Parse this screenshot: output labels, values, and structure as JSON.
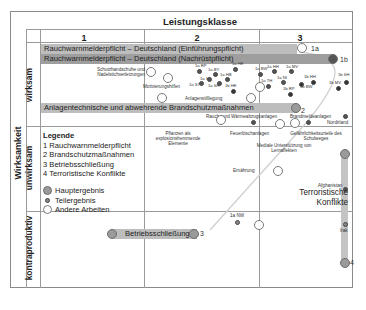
{
  "header": {
    "title": "Leistungsklasse",
    "columns": [
      "1",
      "2",
      "3"
    ]
  },
  "axis": {
    "main_label": "Wirksamkeit",
    "rows": [
      "wirksam",
      "unwirksam",
      "kontraproduktiv"
    ]
  },
  "bars": {
    "bar_1a": "Rauchwarnmelderpflicht – Deutschland (Einführungspflicht)",
    "bar_1b": "Rauchwarnmelderpflicht – Deutschland (Nachrüstpflicht)",
    "bar_2": "Anlagentechnische und abwehrende Brandschutzmaßnahmen",
    "bar_3": "Betriebsschließung"
  },
  "markers": {
    "m1a": "1a",
    "m1b": "1b",
    "m2": "2",
    "m3": "3",
    "m4": "4"
  },
  "labels": {
    "schutz": "Schutzhandschuhe und Nadelstichverletzungen",
    "motiv": "Motivierungshilfen",
    "anlagen": "Anlagenstilllegung",
    "rauch": "Rauch- und Wärmeabzugsanlagen",
    "brandmelde": "Brandmeldeanlagen",
    "nordirland": "Nordirland",
    "pflanzen": "Pflanzen als explosionshemmende Elemente",
    "feuer": "Feuerlöschanlagen",
    "gefahr": "Gefährlichkeitsurteile des Schulweges",
    "mediale": "Mediale Unterstützung von Lernaffekten",
    "ernaehrung": "Ernährung",
    "afghanistan": "Afghanistan",
    "terror": "Terroristische Konflikte",
    "irak": "Irak",
    "nw": "1a NW",
    "rp_a": "1a RP",
    "by": "1a BY",
    "he_a": "1a HE",
    "hb": "1a HB",
    "st": "1a ST",
    "sl": "1a SL",
    "sh_a": "1a SH",
    "he_b": "1b HE",
    "bw_a": "1a BW",
    "hh_a": "1a HH",
    "mv_a": "1a MV",
    "th": "1a TH",
    "ni": "1a NI",
    "hh_b": "1b HH",
    "sh_b": "1b SH",
    "bw_b": "1b BW",
    "mv_b": "1b MV",
    "rp_b": "1b RP"
  },
  "legend": {
    "title": "Legende",
    "items": [
      "1 Rauchwarnmelderpflicht",
      "2 Brandschutzmaßnahmen",
      "3 Betriebsschließung",
      "4 Terroristische Konflikte"
    ],
    "symbols": [
      "Hauptergebnis",
      "Teilergebnis",
      "Andere Arbeiten"
    ]
  }
}
